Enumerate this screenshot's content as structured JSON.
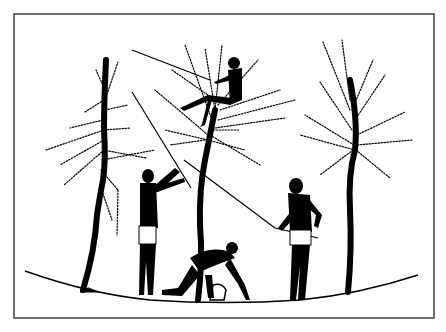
{
  "image": {
    "description": "Black-figure style illustration of an olive harvest: four figures beating and gathering from three trees",
    "colors": {
      "background": "#ffffff",
      "ink": "#000000",
      "frame": "#222222"
    },
    "figures": [
      {
        "name": "figure-in-tree",
        "pose": "sitting in central tree holding pole"
      },
      {
        "name": "figure-left-standing",
        "pose": "standing, striking tree with long pole"
      },
      {
        "name": "figure-crouching",
        "pose": "crouching, gathering fruit into basket"
      },
      {
        "name": "figure-right-standing",
        "pose": "standing, holding long pole"
      }
    ],
    "trees": [
      "left-tree",
      "center-tree",
      "right-tree"
    ]
  }
}
